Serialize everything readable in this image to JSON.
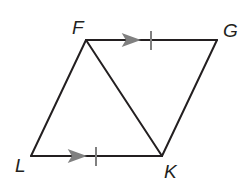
{
  "diagram": {
    "type": "parallelogram with diagonal",
    "vertices": {
      "F": {
        "label": "F",
        "x": 86,
        "y": 40
      },
      "G": {
        "label": "G",
        "x": 217,
        "y": 40
      },
      "K": {
        "label": "K",
        "x": 162,
        "y": 156
      },
      "L": {
        "label": "L",
        "x": 31,
        "y": 156
      }
    },
    "segments": [
      "FG",
      "GK",
      "KL",
      "LF",
      "FK"
    ],
    "markings": {
      "FG": {
        "parallel_arrow": 1,
        "congruence_ticks": 1
      },
      "LK": {
        "parallel_arrow": 1,
        "congruence_ticks": 1
      }
    },
    "colors": {
      "line": "#231f20",
      "marking": "#808080"
    }
  }
}
